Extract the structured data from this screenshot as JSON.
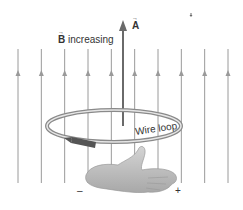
{
  "diagram": {
    "labels": {
      "b_symbol": "B",
      "b_text": " increasing",
      "area_vector": "A",
      "loop": "Wire loop",
      "minus": "–",
      "plus": "+"
    },
    "field_lines": {
      "count": 10,
      "direction": "up"
    },
    "colors": {
      "field_line": "#9a9a9a",
      "area_arrow": "#6a6a6a",
      "loop": "#8a8a8a",
      "current_arrow": "#555555",
      "hand": "#b8b8b8",
      "text": "#333333"
    }
  }
}
